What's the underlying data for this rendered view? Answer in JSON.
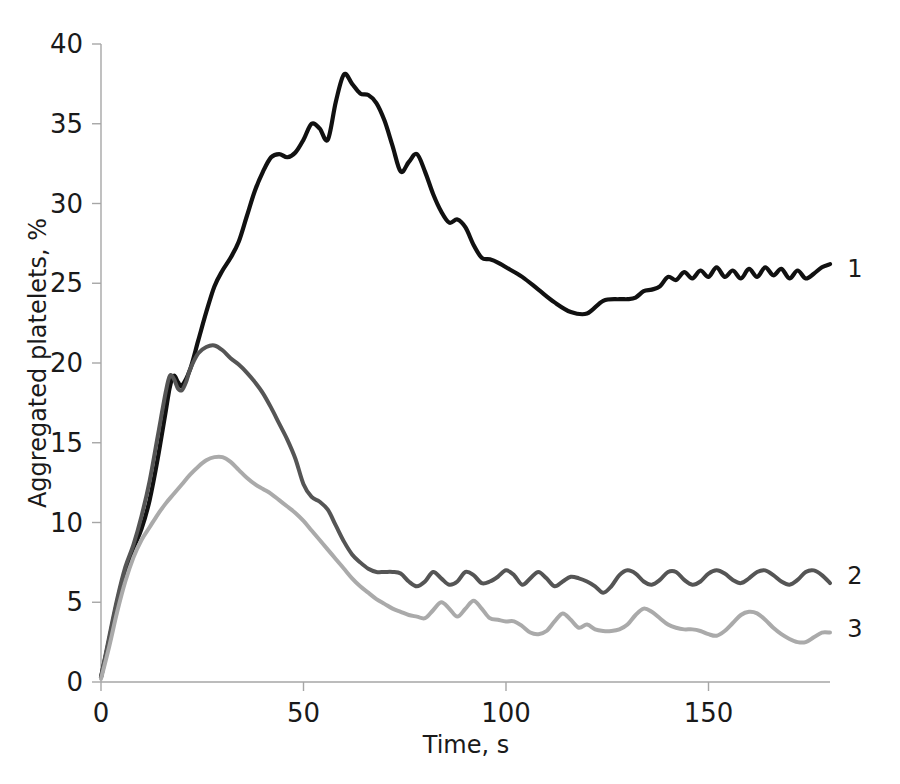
{
  "chart_data": {
    "type": "line",
    "title": "",
    "xlabel": "Time, s",
    "ylabel": "Aggregated platelets, %",
    "xlim": [
      0,
      180
    ],
    "ylim": [
      0,
      40
    ],
    "grid": false,
    "legend_position": "right-end-of-line",
    "xticks": [
      0,
      50,
      100,
      150
    ],
    "xtick_labels": [
      "0",
      "50",
      "100",
      "150"
    ],
    "yticks": [
      0,
      5,
      10,
      15,
      20,
      25,
      30,
      35,
      40
    ],
    "ytick_labels": [
      "0",
      "5",
      "10",
      "15",
      "20",
      "25",
      "30",
      "35",
      "40"
    ],
    "colors": {
      "series1": "#111111",
      "series2": "#555555",
      "series3": "#aaaaaa",
      "axis": "#a6a6a6",
      "text": "#1a1a1a",
      "background": "#ffffff"
    },
    "series": [
      {
        "name": "1",
        "label": "1",
        "color": "#111111",
        "width": 4.2,
        "x": [
          0,
          2,
          4,
          6,
          8,
          10,
          12,
          14,
          16,
          17,
          18,
          19,
          20,
          22,
          24,
          26,
          28,
          30,
          32,
          34,
          36,
          38,
          40,
          42,
          44,
          46,
          48,
          50,
          52,
          54,
          56,
          58,
          60,
          62,
          64,
          66,
          68,
          70,
          72,
          74,
          76,
          78,
          80,
          82,
          84,
          86,
          88,
          90,
          92,
          94,
          96,
          98,
          100,
          104,
          108,
          112,
          116,
          120,
          124,
          128,
          130,
          132,
          134,
          136,
          138,
          140,
          142,
          144,
          146,
          148,
          150,
          152,
          154,
          156,
          158,
          160,
          162,
          164,
          166,
          168,
          170,
          172,
          174,
          176,
          178,
          180
        ],
        "y": [
          0.3,
          2.6,
          5.0,
          7.0,
          8.4,
          9.6,
          11.4,
          14.0,
          17.0,
          18.5,
          19.2,
          18.8,
          18.6,
          19.6,
          21.4,
          23.2,
          24.8,
          25.8,
          26.6,
          27.6,
          29.2,
          30.8,
          32.0,
          32.9,
          33.1,
          32.9,
          33.2,
          34.0,
          35.0,
          34.7,
          34.0,
          36.4,
          38.1,
          37.5,
          36.9,
          36.8,
          36.3,
          35.2,
          33.6,
          32.0,
          32.6,
          33.1,
          32.0,
          30.6,
          29.5,
          28.8,
          29.0,
          28.5,
          27.4,
          26.6,
          26.5,
          26.3,
          26.0,
          25.4,
          24.6,
          23.8,
          23.2,
          23.1,
          23.9,
          24.0,
          24.0,
          24.1,
          24.5,
          24.6,
          24.8,
          25.4,
          25.2,
          25.7,
          25.3,
          25.8,
          25.4,
          26.0,
          25.4,
          25.8,
          25.3,
          25.9,
          25.4,
          26.0,
          25.5,
          25.9,
          25.3,
          25.8,
          25.3,
          25.6,
          26.0,
          26.2
        ]
      },
      {
        "name": "2",
        "label": "2",
        "color": "#555555",
        "width": 4.0,
        "x": [
          0,
          2,
          4,
          6,
          8,
          10,
          12,
          14,
          16,
          17,
          18,
          19,
          20,
          21,
          22,
          24,
          26,
          28,
          30,
          32,
          34,
          36,
          38,
          40,
          42,
          44,
          46,
          48,
          50,
          52,
          54,
          56,
          58,
          60,
          62,
          64,
          66,
          68,
          70,
          72,
          74,
          76,
          78,
          80,
          82,
          84,
          86,
          88,
          90,
          92,
          94,
          96,
          98,
          100,
          102,
          104,
          106,
          108,
          110,
          112,
          114,
          116,
          118,
          120,
          122,
          124,
          126,
          128,
          130,
          132,
          134,
          136,
          138,
          140,
          142,
          144,
          146,
          148,
          150,
          152,
          154,
          156,
          158,
          160,
          162,
          164,
          166,
          168,
          170,
          172,
          174,
          176,
          178,
          180
        ],
        "y": [
          0.3,
          2.8,
          5.2,
          7.2,
          8.6,
          10.4,
          12.6,
          15.4,
          18.2,
          19.2,
          19.0,
          18.4,
          18.3,
          18.8,
          19.6,
          20.6,
          21.0,
          21.1,
          20.8,
          20.3,
          19.9,
          19.4,
          18.8,
          18.1,
          17.2,
          16.2,
          15.2,
          14.0,
          12.4,
          11.6,
          11.3,
          10.8,
          9.8,
          8.8,
          8.0,
          7.5,
          7.1,
          6.9,
          6.9,
          6.9,
          6.8,
          6.3,
          6.0,
          6.3,
          6.9,
          6.5,
          6.1,
          6.3,
          6.9,
          6.7,
          6.2,
          6.3,
          6.6,
          7.0,
          6.7,
          6.1,
          6.5,
          6.9,
          6.5,
          6.0,
          6.3,
          6.6,
          6.5,
          6.3,
          6.0,
          5.6,
          6.0,
          6.7,
          7.0,
          6.8,
          6.3,
          6.1,
          6.4,
          6.9,
          6.9,
          6.4,
          6.1,
          6.3,
          6.8,
          7.0,
          6.8,
          6.4,
          6.2,
          6.5,
          6.9,
          7.0,
          6.7,
          6.3,
          6.1,
          6.4,
          6.9,
          7.0,
          6.7,
          6.2
        ]
      },
      {
        "name": "3",
        "label": "3",
        "color": "#aaaaaa",
        "width": 4.0,
        "x": [
          0,
          2,
          4,
          6,
          8,
          10,
          12,
          14,
          16,
          18,
          20,
          22,
          24,
          26,
          28,
          30,
          32,
          34,
          36,
          38,
          40,
          42,
          44,
          46,
          48,
          50,
          52,
          54,
          56,
          58,
          60,
          62,
          64,
          66,
          68,
          70,
          72,
          74,
          76,
          78,
          80,
          82,
          84,
          86,
          88,
          90,
          92,
          94,
          96,
          98,
          100,
          102,
          104,
          106,
          108,
          110,
          112,
          114,
          116,
          118,
          120,
          122,
          124,
          126,
          128,
          130,
          132,
          134,
          136,
          138,
          140,
          142,
          144,
          146,
          148,
          150,
          152,
          154,
          156,
          158,
          160,
          162,
          164,
          166,
          168,
          170,
          172,
          174,
          176,
          178,
          180
        ],
        "y": [
          0.2,
          2.2,
          4.4,
          6.3,
          7.8,
          8.9,
          9.7,
          10.5,
          11.2,
          11.8,
          12.4,
          13.0,
          13.5,
          13.9,
          14.1,
          14.1,
          13.8,
          13.3,
          12.8,
          12.4,
          12.1,
          11.8,
          11.4,
          11.0,
          10.6,
          10.1,
          9.5,
          8.9,
          8.3,
          7.7,
          7.1,
          6.5,
          6.0,
          5.6,
          5.2,
          4.9,
          4.6,
          4.4,
          4.2,
          4.1,
          4.0,
          4.5,
          5.0,
          4.6,
          4.1,
          4.6,
          5.1,
          4.6,
          4.0,
          3.9,
          3.8,
          3.8,
          3.5,
          3.1,
          3.0,
          3.2,
          3.8,
          4.3,
          3.9,
          3.4,
          3.6,
          3.3,
          3.2,
          3.2,
          3.3,
          3.6,
          4.2,
          4.6,
          4.4,
          4.0,
          3.6,
          3.4,
          3.3,
          3.3,
          3.2,
          3.0,
          2.9,
          3.2,
          3.7,
          4.2,
          4.4,
          4.3,
          3.9,
          3.4,
          3.0,
          2.7,
          2.5,
          2.5,
          2.8,
          3.1,
          3.1
        ]
      }
    ]
  },
  "axis": {
    "y_title": "Aggregated platelets, %",
    "x_title": "Time, s"
  },
  "series_labels": {
    "one": "1",
    "two": "2",
    "three": "3"
  }
}
